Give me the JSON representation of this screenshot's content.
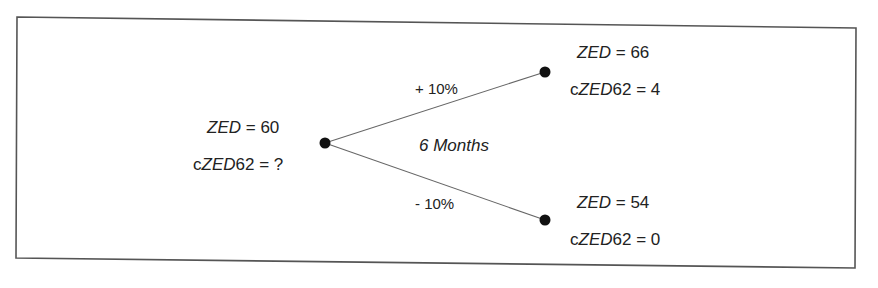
{
  "diagram": {
    "type": "binomial-tree",
    "period_label": "6 Months",
    "root": {
      "var_name": "ZED",
      "var_value": "60",
      "option_prefix": "c",
      "option_name": "ZED",
      "option_suffix": "62",
      "option_value": "?"
    },
    "up": {
      "edge_label": "+ 10%",
      "var_name": "ZED",
      "var_value": "66",
      "option_prefix": "c",
      "option_name": "ZED",
      "option_suffix": "62",
      "option_value": "4"
    },
    "down": {
      "edge_label": "- 10%",
      "var_name": "ZED",
      "var_value": "54",
      "option_prefix": "c",
      "option_name": "ZED",
      "option_suffix": "62",
      "option_value": "0"
    },
    "eq": " = ",
    "colors": {
      "border": "#555555",
      "edge": "#666666",
      "node": "#111111",
      "text": "#222222"
    }
  }
}
